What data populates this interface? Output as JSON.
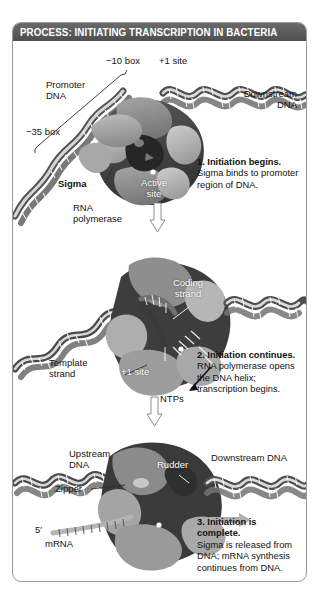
{
  "figure": {
    "title": "PROCESS: INITIATING TRANSCRIPTION IN BACTERIA",
    "title_bar_color": "#555555",
    "border_color": "#9a9a9a",
    "background_color": "#ffffff"
  },
  "palette": {
    "dna_light": "#d8d8d8",
    "dna_dark": "#4a4a4a",
    "polymerase_light": "#b9b9b9",
    "polymerase_mid": "#8f8f8f",
    "polymerase_dark": "#3f3f3f",
    "cleft_dark": "#2a2a2a",
    "sigma_gray": "#9e9e9e",
    "text_black": "#141414",
    "text_white": "#ffffff"
  },
  "panels": [
    {
      "id": "panel-1",
      "labels": [
        {
          "name": "promoter-dna-label",
          "text": "Promoter\nDNA",
          "bold": false,
          "color": "black"
        },
        {
          "name": "minus-10-box-label",
          "text": "−10 box",
          "bold": false,
          "color": "black"
        },
        {
          "name": "minus-35-box-label",
          "text": "−35 box",
          "bold": false,
          "color": "black"
        },
        {
          "name": "plus-1-site-label",
          "text": "+1 site",
          "bold": false,
          "color": "black"
        },
        {
          "name": "downstream-dna-label",
          "text": "Downstream\nDNA",
          "bold": false,
          "color": "black"
        },
        {
          "name": "sigma-label",
          "text": "Sigma",
          "bold": true,
          "color": "black"
        },
        {
          "name": "active-site-label",
          "text": "Active\nsite",
          "bold": false,
          "color": "white"
        },
        {
          "name": "rna-polymerase-label",
          "text": "RNA\npolymerase",
          "bold": false,
          "color": "black"
        }
      ],
      "step": {
        "number_and_heading": "1. Initiation begins.",
        "body": "Sigma binds to promoter region of DNA."
      }
    },
    {
      "id": "panel-2",
      "labels": [
        {
          "name": "coding-strand-label",
          "text": "Coding\nstrand",
          "bold": false,
          "color": "white"
        },
        {
          "name": "template-strand-label",
          "text": "Template\nstrand",
          "bold": false,
          "color": "black"
        },
        {
          "name": "plus-1-site-label",
          "text": "+1 site",
          "bold": false,
          "color": "white"
        },
        {
          "name": "ntps-label",
          "text": "NTPs",
          "bold": false,
          "color": "black"
        }
      ],
      "step": {
        "number_and_heading": "2. Initiation continues.",
        "body": "RNA polymerase opens the DNA helix; transcription begins."
      }
    },
    {
      "id": "panel-3",
      "labels": [
        {
          "name": "upstream-dna-label",
          "text": "Upstream\nDNA",
          "bold": false,
          "color": "black"
        },
        {
          "name": "zipper-label",
          "text": "Zipper",
          "bold": false,
          "color": "black"
        },
        {
          "name": "rudder-label",
          "text": "Rudder",
          "bold": false,
          "color": "white"
        },
        {
          "name": "downstream-dna-label",
          "text": "Downstream DNA",
          "bold": false,
          "color": "black"
        },
        {
          "name": "five-prime-label",
          "text": "5′",
          "bold": false,
          "color": "black"
        },
        {
          "name": "mrna-label",
          "text": "mRNA",
          "bold": false,
          "color": "black"
        }
      ],
      "step": {
        "number_and_heading": "3. Initiation is complete.",
        "body": "Sigma is released from DNA; mRNA synthesis continues from DNA."
      }
    }
  ],
  "connectors": [
    {
      "name": "step-1-to-2-arrow",
      "direction": "down",
      "style": "hollow-outline"
    },
    {
      "name": "step-2-to-3-arrow",
      "direction": "down",
      "style": "hollow-outline"
    },
    {
      "name": "transcription-direction-arrow",
      "direction": "right",
      "style": "solid-gray"
    }
  ]
}
